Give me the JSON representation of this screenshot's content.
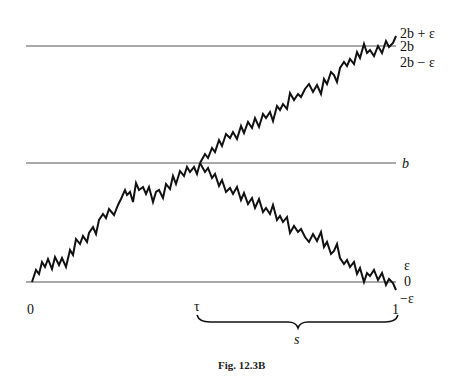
{
  "figure": {
    "caption": "Fig. 12.3B",
    "right_labels": {
      "two_b_plus_eps": "2b + ε",
      "two_b": "2b",
      "two_b_minus_eps": "2b − ε",
      "b": "b",
      "eps": "ε",
      "zero": "0",
      "minus_eps": "−ε"
    },
    "bottom_labels": {
      "start": "0",
      "tau": "τ",
      "end": "1",
      "s": "s"
    },
    "horizontal_levels": [
      "2b",
      "b",
      "0"
    ],
    "paths": {
      "original_path": "Brownian path from 0 rising through b at τ, continuing up to ~2b at time 1",
      "reflected_path": "Path reflected about b after τ, descending to ~0 at time 1"
    }
  }
}
